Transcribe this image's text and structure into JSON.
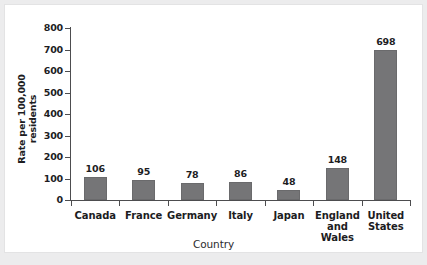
{
  "chart_data": {
    "type": "bar",
    "title": "",
    "xlabel": "Country",
    "ylabel": "Rate per 100,000\nresidents",
    "ylabel_line1": "Rate per 100,000",
    "ylabel_line2": "residents",
    "categories": [
      "Canada",
      "France",
      "Germany",
      "Italy",
      "Japan",
      "England\nand Wales",
      "United\nStates"
    ],
    "values": [
      106,
      95,
      78,
      86,
      48,
      148,
      698
    ],
    "value_labels": [
      "106",
      "95",
      "78",
      "86",
      "48",
      "148",
      "698"
    ],
    "ylim": [
      0,
      800
    ],
    "yticks": [
      0,
      100,
      200,
      300,
      400,
      500,
      600,
      700,
      800
    ],
    "ytick_labels": [
      "0",
      "100",
      "200",
      "300",
      "400",
      "500",
      "600",
      "700",
      "800"
    ],
    "grid": false,
    "legend": false,
    "bar_color": "#757577",
    "axis_color": "#4d4d4f",
    "background": "#ffffff"
  }
}
